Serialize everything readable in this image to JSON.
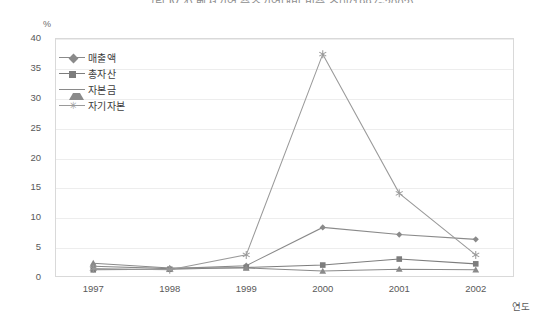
{
  "chart_data": {
    "type": "line",
    "title": "그림 Ⅳ-4) 벤처기업 중소기업대비 비중 추이(1997~2002)",
    "xlabel": "연도",
    "ylabel": "%",
    "categories": [
      "1997",
      "1998",
      "1999",
      "2000",
      "2001",
      "2002"
    ],
    "xlim": [
      1997,
      2002
    ],
    "ylim": [
      0,
      40
    ],
    "ytick_labels": [
      "0",
      "5",
      "10",
      "15",
      "20",
      "25",
      "30",
      "35",
      "40"
    ],
    "ytick_values": [
      0,
      5,
      10,
      15,
      20,
      25,
      30,
      35,
      40
    ],
    "grid": true,
    "legend_position": "top-left-inside",
    "series": [
      {
        "name": "매출액",
        "marker": "diamond",
        "color": "#8a8a8a",
        "values": [
          1.8,
          1.4,
          1.9,
          8.3,
          7.1,
          6.3
        ]
      },
      {
        "name": "총자산",
        "marker": "square",
        "color": "#7d7d7d",
        "values": [
          1.2,
          1.3,
          1.6,
          2.0,
          3.0,
          2.2
        ]
      },
      {
        "name": "자본금",
        "marker": "triangle",
        "color": "#8a8a8a",
        "values": [
          2.3,
          1.5,
          1.5,
          1.0,
          1.3,
          1.2
        ]
      },
      {
        "name": "자기자본",
        "marker": "star",
        "color": "#9a9a9a",
        "values": [
          1.4,
          1.2,
          3.7,
          37.3,
          14.0,
          3.7
        ]
      }
    ]
  },
  "axis": {
    "unit_label": "%",
    "x_axis_title": "연도"
  },
  "colors": {
    "plot_border": "#d9d9d9",
    "gridline": "#ededed",
    "text": "#4a4a4a",
    "background": "#ffffff"
  }
}
